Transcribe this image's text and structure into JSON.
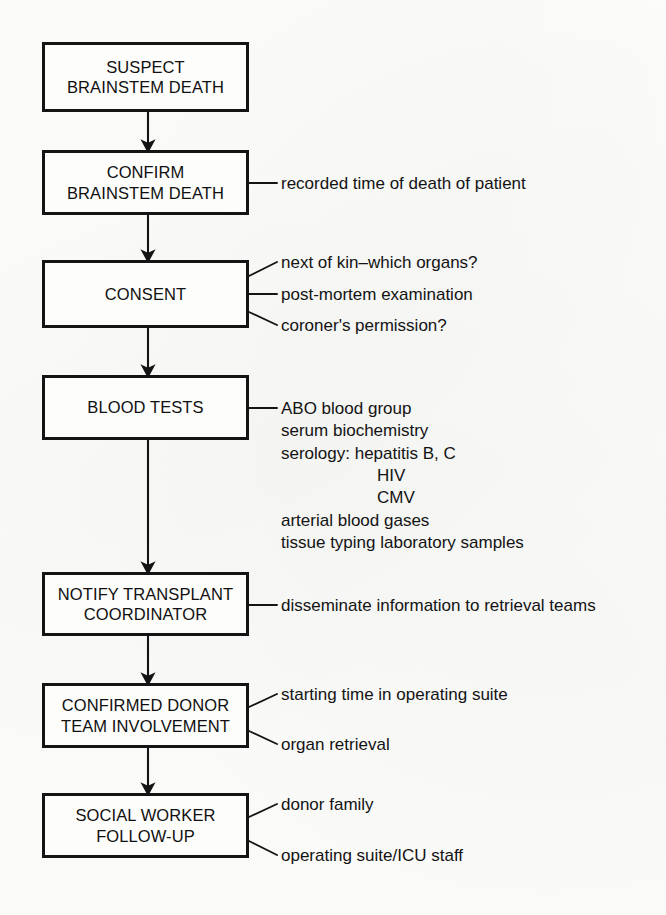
{
  "diagram": {
    "type": "flowchart",
    "orientation": "vertical",
    "colors": {
      "background": "#fdfdfb",
      "box_border": "#141414",
      "text": "#131313",
      "connector": "#141414"
    },
    "nodes": [
      {
        "id": "suspect-brainstem-death",
        "lines": [
          "SUSPECT",
          "BRAINSTEM DEATH"
        ],
        "annotations": []
      },
      {
        "id": "confirm-brainstem-death",
        "lines": [
          "CONFIRM",
          "BRAINSTEM DEATH"
        ],
        "annotations": [
          "recorded time of death of patient"
        ]
      },
      {
        "id": "consent",
        "lines": [
          "CONSENT"
        ],
        "annotations": [
          "next of kin–which organs?",
          "post-mortem examination",
          "coroner's permission?"
        ]
      },
      {
        "id": "blood-tests",
        "lines": [
          "BLOOD TESTS"
        ],
        "annotations": [
          "ABO blood group",
          "serum biochemistry",
          "serology:  hepatitis B, C",
          "HIV",
          "CMV",
          "arterial blood gases",
          "tissue typing laboratory samples"
        ]
      },
      {
        "id": "notify-transplant-coordinator",
        "lines": [
          "NOTIFY TRANSPLANT",
          "COORDINATOR"
        ],
        "annotations": [
          "disseminate information to retrieval teams"
        ]
      },
      {
        "id": "confirmed-donor-team-involvement",
        "lines": [
          "CONFIRMED DONOR",
          "TEAM INVOLVEMENT"
        ],
        "annotations": [
          "starting time in operating suite",
          "organ retrieval"
        ]
      },
      {
        "id": "social-worker-follow-up",
        "lines": [
          "SOCIAL WORKER",
          "FOLLOW-UP"
        ],
        "annotations": [
          "donor family",
          "operating suite/ICU staff"
        ]
      }
    ]
  },
  "boxes": {
    "b1": {
      "l1": "SUSPECT",
      "l2": "BRAINSTEM DEATH"
    },
    "b2": {
      "l1": "CONFIRM",
      "l2": "BRAINSTEM DEATH"
    },
    "b3": {
      "l1": "CONSENT"
    },
    "b4": {
      "l1": "BLOOD TESTS"
    },
    "b5": {
      "l1": "NOTIFY TRANSPLANT",
      "l2": "COORDINATOR"
    },
    "b6": {
      "l1": "CONFIRMED DONOR",
      "l2": "TEAM INVOLVEMENT"
    },
    "b7": {
      "l1": "SOCIAL WORKER",
      "l2": "FOLLOW-UP"
    }
  },
  "annotations": {
    "confirm": {
      "a1": "recorded time of death of patient"
    },
    "consent": {
      "a1": "next of kin–which organs?",
      "a2": "post-mortem examination",
      "a3": "coroner's permission?"
    },
    "blood_tests": {
      "r1": "ABO blood group",
      "r2": "serum biochemistry",
      "r3": "serology:  hepatitis B, C",
      "r4": "HIV",
      "r5": "CMV",
      "r6": "arterial blood gases",
      "r7": "tissue typing laboratory samples"
    },
    "notify": {
      "a1": "disseminate information to retrieval teams"
    },
    "confirmed_donor": {
      "a1": "starting time in operating suite",
      "a2": "organ retrieval"
    },
    "social_worker": {
      "a1": "donor family",
      "a2": "operating suite/ICU staff"
    }
  }
}
